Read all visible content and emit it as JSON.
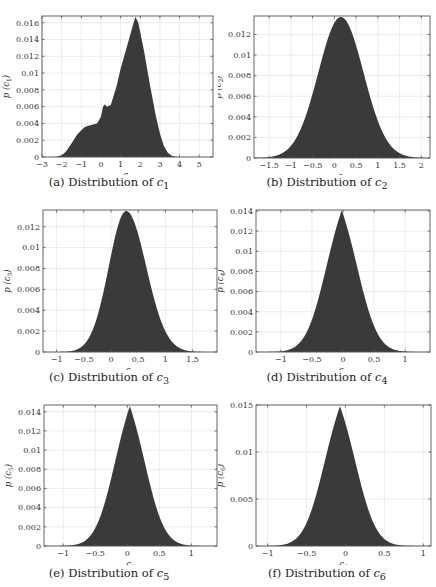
{
  "figure": {
    "panels": [
      {
        "id": "a",
        "caption_prefix": "(a) Distribution of ",
        "var": "c",
        "sub": "1",
        "ylabel": "p (c1)",
        "xlabel": "c1"
      },
      {
        "id": "b",
        "caption_prefix": "(b) Distribution of ",
        "var": "c",
        "sub": "2",
        "ylabel": "p (c2)",
        "xlabel": "c2"
      },
      {
        "id": "c",
        "caption_prefix": "(c) Distribution of ",
        "var": "c",
        "sub": "3",
        "ylabel": "p (c3)",
        "xlabel": "c3"
      },
      {
        "id": "d",
        "caption_prefix": "(d) Distribution of ",
        "var": "c",
        "sub": "4",
        "ylabel": "p (c4)",
        "xlabel": "c4"
      },
      {
        "id": "e",
        "caption_prefix": "(e) Distribution of ",
        "var": "c",
        "sub": "5",
        "ylabel": "p (c5)",
        "xlabel": "c5"
      },
      {
        "id": "f",
        "caption_prefix": "(f) Distribution of ",
        "var": "c",
        "sub": "6",
        "ylabel": "p (c6)",
        "xlabel": "c6"
      }
    ],
    "fill_color": "#3a3a3a",
    "grid_color": "#e6e6e6",
    "axis_color": "#555555"
  },
  "chart_data": [
    {
      "type": "area",
      "title": "(a) Distribution of c1",
      "xlabel": "c1",
      "ylabel": "p (c1)",
      "xlim": [
        -3,
        5.7
      ],
      "ylim": [
        0,
        0.0168
      ],
      "xticks": [
        -3,
        -2,
        -1,
        0,
        1,
        2,
        3,
        4,
        5
      ],
      "xtick_labels": [
        "−3",
        "−2",
        "−1",
        "0",
        "1",
        "2",
        "3",
        "4",
        "5"
      ],
      "yticks": [
        0,
        0.002,
        0.004,
        0.006,
        0.008,
        0.01,
        0.012,
        0.014,
        0.016
      ],
      "ytick_labels": [
        "0",
        "0.002",
        "0.004",
        "0.006",
        "0.008",
        "0.01",
        "0.012",
        "0.014",
        "0.016"
      ],
      "grid": true,
      "x": [
        -3,
        -2.4,
        -2.2,
        -2.0,
        -1.8,
        -1.5,
        -1.2,
        -1.0,
        -0.8,
        -0.5,
        -0.2,
        0.0,
        0.1,
        0.2,
        0.3,
        0.5,
        0.8,
        1.0,
        1.3,
        1.6,
        1.75,
        1.9,
        2.2,
        2.5,
        2.8,
        3.0,
        3.2,
        3.4,
        3.6,
        3.8,
        4.0,
        4.5,
        5.7
      ],
      "y": [
        0,
        0,
        5e-05,
        0.0002,
        0.0006,
        0.0016,
        0.0027,
        0.0032,
        0.0036,
        0.0038,
        0.004,
        0.0048,
        0.006,
        0.0063,
        0.006,
        0.0062,
        0.0085,
        0.0105,
        0.013,
        0.0155,
        0.0167,
        0.016,
        0.0125,
        0.0085,
        0.0048,
        0.0028,
        0.0013,
        0.0005,
        0.00015,
        4e-05,
        0,
        0,
        0
      ]
    },
    {
      "type": "area",
      "title": "(b) Distribution of c2",
      "xlabel": "c2",
      "ylabel": "p (c2)",
      "xlim": [
        -1.85,
        2.2
      ],
      "ylim": [
        0,
        0.0138
      ],
      "xticks": [
        -1.5,
        -1,
        -0.5,
        0,
        0.5,
        1,
        1.5,
        2
      ],
      "xtick_labels": [
        "−1.5",
        "−1",
        "−0.5",
        "0",
        "0.5",
        "1",
        "1.5",
        "2"
      ],
      "yticks": [
        0,
        0.002,
        0.004,
        0.006,
        0.008,
        0.01,
        0.012
      ],
      "ytick_labels": [
        "0",
        "0.002",
        "0.004",
        "0.006",
        "0.008",
        "0.01",
        "0.012"
      ],
      "grid": true,
      "gaussian": {
        "mu": 0.15,
        "sigma": 0.52,
        "peak": 0.0137
      }
    },
    {
      "type": "area",
      "title": "(c) Distribution of c3",
      "xlabel": "c3",
      "ylabel": "p (c3)",
      "xlim": [
        -1.25,
        1.95
      ],
      "ylim": [
        0,
        0.0136
      ],
      "xticks": [
        -1,
        -0.5,
        0,
        0.5,
        1,
        1.5
      ],
      "xtick_labels": [
        "−1",
        "−0.5",
        "0",
        "0.5",
        "1",
        "1.5"
      ],
      "yticks": [
        0,
        0.002,
        0.004,
        0.006,
        0.008,
        0.01,
        0.012
      ],
      "ytick_labels": [
        "0",
        "0.002",
        "0.004",
        "0.006",
        "0.008",
        "0.01",
        "0.012"
      ],
      "grid": true,
      "gaussian": {
        "mu": 0.28,
        "sigma": 0.32,
        "peak": 0.0135,
        "skew_right": 1.15
      }
    },
    {
      "type": "area",
      "title": "(d) Distribution of c4",
      "xlabel": "c4",
      "ylabel": "p (c4)",
      "xlim": [
        -1.4,
        1.4
      ],
      "ylim": [
        0,
        0.0141
      ],
      "xticks": [
        -1,
        -0.5,
        0,
        0.5,
        1
      ],
      "xtick_labels": [
        "−1",
        "−0.5",
        "0",
        "0.5",
        "1"
      ],
      "yticks": [
        0,
        0.002,
        0.004,
        0.006,
        0.008,
        0.01,
        0.012,
        0.014
      ],
      "ytick_labels": [
        "0",
        "0.002",
        "0.004",
        "0.006",
        "0.008",
        "0.01",
        "0.012",
        "0.014"
      ],
      "grid": true,
      "gaussian": {
        "mu": -0.02,
        "sigma": 0.3,
        "peak": 0.0141,
        "heavy_tail": true
      }
    },
    {
      "type": "area",
      "title": "(e) Distribution of c5",
      "xlabel": "c5",
      "ylabel": "p (c5)",
      "xlim": [
        -1.3,
        1.4
      ],
      "ylim": [
        0,
        0.0147
      ],
      "xticks": [
        -1,
        -0.5,
        0,
        0.5,
        1
      ],
      "xtick_labels": [
        "−1",
        "−0.5",
        "0",
        "0.5",
        "1"
      ],
      "yticks": [
        0,
        0.002,
        0.004,
        0.006,
        0.008,
        0.01,
        0.012,
        0.014
      ],
      "ytick_labels": [
        "0",
        "0.002",
        "0.004",
        "0.006",
        "0.008",
        "0.01",
        "0.012",
        "0.014"
      ],
      "grid": true,
      "gaussian": {
        "mu": 0.04,
        "sigma": 0.28,
        "peak": 0.0146,
        "heavy_tail": true
      }
    },
    {
      "type": "area",
      "title": "(f) Distribution of c6",
      "xlabel": "c6",
      "ylabel": "p (c6)",
      "xlim": [
        -1.15,
        1.1
      ],
      "ylim": [
        0,
        0.015
      ],
      "xticks": [
        -1,
        -0.5,
        0,
        0.5,
        1
      ],
      "xtick_labels": [
        "−1",
        "−0.5",
        "0",
        "0.5",
        "1"
      ],
      "yticks": [
        0,
        0.005,
        0.01,
        0.015
      ],
      "ytick_labels": [
        "0",
        "0.005",
        "0.01",
        "0.015"
      ],
      "grid": true,
      "gaussian": {
        "mu": -0.07,
        "sigma": 0.24,
        "peak": 0.0149,
        "heavy_tail": true
      }
    }
  ]
}
